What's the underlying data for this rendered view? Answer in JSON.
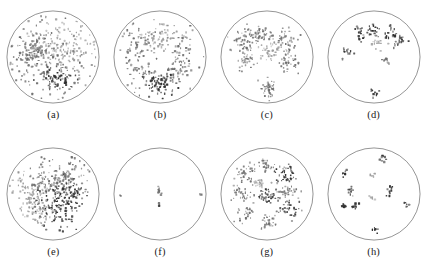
{
  "figure": {
    "background_color": "#ffffff",
    "circle_stroke_color": "#3b3b3b",
    "point_color_light": "#9a9a9a",
    "point_color_mid": "#6e6e6e",
    "point_color_dark": "#2e2e2e",
    "rows": 2,
    "columns": 4
  },
  "panels": [
    {
      "id": "a",
      "caption": "(a)"
    },
    {
      "id": "b",
      "caption": "(b)"
    },
    {
      "id": "c",
      "caption": "(c)"
    },
    {
      "id": "d",
      "caption": "(d)"
    },
    {
      "id": "e",
      "caption": "(e)"
    },
    {
      "id": "f",
      "caption": "(f)"
    },
    {
      "id": "g",
      "caption": "(g)"
    },
    {
      "id": "h",
      "caption": "(h)"
    }
  ],
  "chart_data": {
    "type": "scatter",
    "title": "",
    "xlabel": "",
    "ylabel": "",
    "xlim": [
      -1,
      1
    ],
    "ylim": [
      -1,
      1
    ],
    "grid": false,
    "legend": null,
    "axes_visible": false,
    "clip_shape": "circle",
    "clip_radius": 1.0,
    "panel_count": 8,
    "panels": [
      {
        "id": "a",
        "caption": "(a)",
        "point_count": 430,
        "description": "dense diffuse scatter covering most of the disc, heavier toward left-centre and lower-centre",
        "marker_size": 1.6,
        "clusters": [
          {
            "cx": -0.46,
            "cy": 0.06,
            "sx": 0.2,
            "sy": 0.18,
            "n": 95,
            "shade": "mid"
          },
          {
            "cx": -0.05,
            "cy": 0.3,
            "sx": 0.3,
            "sy": 0.25,
            "n": 90,
            "shade": "light"
          },
          {
            "cx": 0.12,
            "cy": -0.48,
            "sx": 0.2,
            "sy": 0.14,
            "n": 70,
            "shade": "dark"
          },
          {
            "cx": 0.38,
            "cy": 0.18,
            "sx": 0.28,
            "sy": 0.3,
            "n": 70,
            "shade": "light"
          },
          {
            "cx": -0.12,
            "cy": -0.1,
            "sx": 0.45,
            "sy": 0.4,
            "n": 105,
            "shade": "mid"
          }
        ]
      },
      {
        "id": "b",
        "caption": "(b)",
        "point_count": 330,
        "description": "scattered points across disc with a pronounced dense dark cluster at bottom-centre",
        "marker_size": 1.6,
        "clusters": [
          {
            "cx": -0.42,
            "cy": 0.28,
            "sx": 0.22,
            "sy": 0.22,
            "n": 70,
            "shade": "mid"
          },
          {
            "cx": 0.06,
            "cy": 0.44,
            "sx": 0.3,
            "sy": 0.16,
            "n": 55,
            "shade": "light"
          },
          {
            "cx": 0.42,
            "cy": 0.1,
            "sx": 0.22,
            "sy": 0.26,
            "n": 50,
            "shade": "mid"
          },
          {
            "cx": -0.4,
            "cy": -0.34,
            "sx": 0.18,
            "sy": 0.16,
            "n": 45,
            "shade": "mid"
          },
          {
            "cx": 0.02,
            "cy": -0.58,
            "sx": 0.16,
            "sy": 0.12,
            "n": 75,
            "shade": "dark"
          },
          {
            "cx": 0.4,
            "cy": -0.3,
            "sx": 0.16,
            "sy": 0.12,
            "n": 35,
            "shade": "mid"
          }
        ]
      },
      {
        "id": "c",
        "caption": "(c)",
        "point_count": 300,
        "description": "several separated clumpy blobs forming a loose ring plus one isolated blob near the bottom",
        "marker_size": 1.5,
        "clusters": [
          {
            "cx": -0.52,
            "cy": 0.36,
            "sx": 0.13,
            "sy": 0.12,
            "n": 55,
            "shade": "mid"
          },
          {
            "cx": -0.12,
            "cy": 0.48,
            "sx": 0.13,
            "sy": 0.09,
            "n": 40,
            "shade": "mid"
          },
          {
            "cx": 0.4,
            "cy": 0.4,
            "sx": 0.13,
            "sy": 0.1,
            "n": 40,
            "shade": "mid"
          },
          {
            "cx": 0.1,
            "cy": 0.1,
            "sx": 0.16,
            "sy": 0.12,
            "n": 45,
            "shade": "light"
          },
          {
            "cx": -0.46,
            "cy": -0.06,
            "sx": 0.11,
            "sy": 0.1,
            "n": 35,
            "shade": "mid"
          },
          {
            "cx": 0.44,
            "cy": -0.08,
            "sx": 0.12,
            "sy": 0.12,
            "n": 40,
            "shade": "mid"
          },
          {
            "cx": 0.02,
            "cy": -0.66,
            "sx": 0.1,
            "sy": 0.08,
            "n": 45,
            "shade": "mid"
          }
        ]
      },
      {
        "id": "d",
        "caption": "(d)",
        "point_count": 120,
        "description": "mostly empty disc with a handful of small dark compact blobs in the upper half and two isolated blobs below",
        "marker_size": 1.7,
        "clusters": [
          {
            "cx": -0.3,
            "cy": 0.5,
            "sx": 0.05,
            "sy": 0.09,
            "n": 18,
            "shade": "dark"
          },
          {
            "cx": 0.04,
            "cy": 0.6,
            "sx": 0.09,
            "sy": 0.06,
            "n": 20,
            "shade": "dark"
          },
          {
            "cx": 0.34,
            "cy": 0.52,
            "sx": 0.06,
            "sy": 0.08,
            "n": 18,
            "shade": "dark"
          },
          {
            "cx": 0.56,
            "cy": 0.34,
            "sx": 0.06,
            "sy": 0.07,
            "n": 16,
            "shade": "dark"
          },
          {
            "cx": 0.1,
            "cy": 0.3,
            "sx": 0.12,
            "sy": 0.08,
            "n": 16,
            "shade": "light"
          },
          {
            "cx": -0.56,
            "cy": 0.12,
            "sx": 0.05,
            "sy": 0.05,
            "n": 12,
            "shade": "dark"
          },
          {
            "cx": 0.26,
            "cy": -0.06,
            "sx": 0.05,
            "sy": 0.05,
            "n": 10,
            "shade": "mid"
          },
          {
            "cx": 0.0,
            "cy": -0.76,
            "sx": 0.05,
            "sy": 0.05,
            "n": 10,
            "shade": "dark"
          }
        ]
      },
      {
        "id": "e",
        "caption": "(e)",
        "point_count": 470,
        "description": "very dense diffuse scatter concentrated in the centre and right-centre of the disc",
        "marker_size": 1.6,
        "clusters": [
          {
            "cx": -0.5,
            "cy": 0.04,
            "sx": 0.18,
            "sy": 0.22,
            "n": 70,
            "shade": "light"
          },
          {
            "cx": -0.1,
            "cy": 0.26,
            "sx": 0.26,
            "sy": 0.24,
            "n": 100,
            "shade": "mid"
          },
          {
            "cx": 0.34,
            "cy": 0.3,
            "sx": 0.22,
            "sy": 0.22,
            "n": 85,
            "shade": "mid"
          },
          {
            "cx": 0.4,
            "cy": -0.06,
            "sx": 0.18,
            "sy": 0.2,
            "n": 80,
            "shade": "dark"
          },
          {
            "cx": -0.02,
            "cy": -0.34,
            "sx": 0.2,
            "sy": 0.22,
            "n": 85,
            "shade": "dark"
          },
          {
            "cx": -0.3,
            "cy": -0.34,
            "sx": 0.18,
            "sy": 0.16,
            "n": 50,
            "shade": "light"
          }
        ]
      },
      {
        "id": "f",
        "caption": "(f)",
        "point_count": 18,
        "description": "almost empty disc: one tiny vertical cluster at the centre and three isolated single points near the rim",
        "marker_size": 1.7,
        "clusters": [
          {
            "cx": -0.02,
            "cy": 0.06,
            "sx": 0.02,
            "sy": 0.07,
            "n": 11,
            "shade": "mid"
          },
          {
            "cx": -0.02,
            "cy": -0.22,
            "sx": 0.02,
            "sy": 0.02,
            "n": 3,
            "shade": "dark"
          },
          {
            "cx": -0.86,
            "cy": -0.02,
            "sx": 0.01,
            "sy": 0.01,
            "n": 2,
            "shade": "mid"
          },
          {
            "cx": 0.88,
            "cy": 0.0,
            "sx": 0.01,
            "sy": 0.01,
            "n": 2,
            "shade": "mid"
          }
        ]
      },
      {
        "id": "g",
        "caption": "(g)",
        "point_count": 360,
        "description": "about ten well separated ring-shaped clusters distributed evenly across the disc",
        "marker_size": 1.5,
        "clusters": [
          {
            "cx": -0.48,
            "cy": 0.44,
            "sx": 0.12,
            "sy": 0.1,
            "n": 38,
            "shade": "mid"
          },
          {
            "cx": -0.04,
            "cy": 0.62,
            "sx": 0.11,
            "sy": 0.09,
            "n": 32,
            "shade": "mid"
          },
          {
            "cx": 0.42,
            "cy": 0.42,
            "sx": 0.13,
            "sy": 0.12,
            "n": 45,
            "shade": "dark"
          },
          {
            "cx": -0.16,
            "cy": 0.24,
            "sx": 0.09,
            "sy": 0.06,
            "n": 22,
            "shade": "light"
          },
          {
            "cx": 0.48,
            "cy": 0.06,
            "sx": 0.13,
            "sy": 0.08,
            "n": 36,
            "shade": "mid"
          },
          {
            "cx": -0.56,
            "cy": 0.0,
            "sx": 0.12,
            "sy": 0.08,
            "n": 32,
            "shade": "mid"
          },
          {
            "cx": 0.02,
            "cy": -0.06,
            "sx": 0.12,
            "sy": 0.11,
            "n": 40,
            "shade": "dark"
          },
          {
            "cx": 0.46,
            "cy": -0.34,
            "sx": 0.12,
            "sy": 0.09,
            "n": 34,
            "shade": "dark"
          },
          {
            "cx": -0.44,
            "cy": -0.42,
            "sx": 0.12,
            "sy": 0.09,
            "n": 32,
            "shade": "mid"
          },
          {
            "cx": 0.02,
            "cy": -0.62,
            "sx": 0.11,
            "sy": 0.09,
            "n": 32,
            "shade": "mid"
          }
        ]
      },
      {
        "id": "h",
        "caption": "(h)",
        "point_count": 95,
        "description": "sparse disc with roughly ten small dark compact blobs spread out, a few faint grey marks near the centre",
        "marker_size": 1.7,
        "clusters": [
          {
            "cx": 0.2,
            "cy": 0.78,
            "sx": 0.04,
            "sy": 0.04,
            "n": 9,
            "shade": "dark"
          },
          {
            "cx": -0.62,
            "cy": 0.44,
            "sx": 0.04,
            "sy": 0.04,
            "n": 9,
            "shade": "dark"
          },
          {
            "cx": -0.02,
            "cy": 0.4,
            "sx": 0.03,
            "sy": 0.03,
            "n": 5,
            "shade": "light"
          },
          {
            "cx": -0.5,
            "cy": 0.08,
            "sx": 0.05,
            "sy": 0.04,
            "n": 10,
            "shade": "dark"
          },
          {
            "cx": 0.34,
            "cy": 0.06,
            "sx": 0.04,
            "sy": 0.07,
            "n": 11,
            "shade": "dark"
          },
          {
            "cx": -0.04,
            "cy": -0.08,
            "sx": 0.03,
            "sy": 0.03,
            "n": 6,
            "shade": "light"
          },
          {
            "cx": -0.66,
            "cy": -0.26,
            "sx": 0.04,
            "sy": 0.04,
            "n": 10,
            "shade": "dark"
          },
          {
            "cx": -0.42,
            "cy": -0.28,
            "sx": 0.04,
            "sy": 0.05,
            "n": 10,
            "shade": "dark"
          },
          {
            "cx": 0.7,
            "cy": -0.22,
            "sx": 0.03,
            "sy": 0.03,
            "n": 7,
            "shade": "dark"
          },
          {
            "cx": 0.06,
            "cy": -0.78,
            "sx": 0.04,
            "sy": 0.04,
            "n": 9,
            "shade": "dark"
          }
        ]
      }
    ]
  }
}
